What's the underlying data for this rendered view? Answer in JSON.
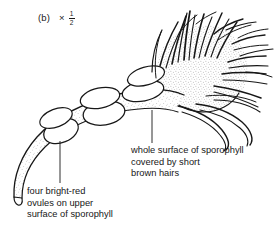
{
  "figure": {
    "panel_label": "(b)",
    "magnification": "×",
    "magnification_numerator": "1",
    "magnification_denominator": "2"
  },
  "annotations": [
    {
      "id": "hairs",
      "lines": [
        "whole surface of sporophyll",
        "covered by short",
        "brown hairs"
      ]
    },
    {
      "id": "ovules",
      "lines": [
        "four bright-red",
        "ovules on upper",
        "surface of sporophyll"
      ]
    }
  ],
  "colors": {
    "ink": "#171717",
    "background": "#ffffff",
    "stipple": "#9a9a9a"
  }
}
